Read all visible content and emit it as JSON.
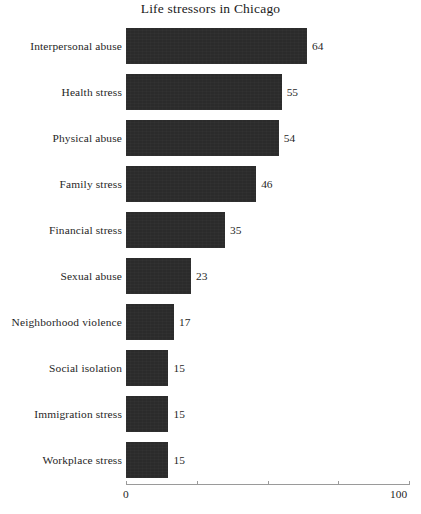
{
  "chart_data": {
    "type": "bar",
    "orientation": "horizontal",
    "title": "Life stressors in Chicago",
    "xlabel": "",
    "ylabel": "",
    "xlim": [
      0,
      100
    ],
    "grid": false,
    "legend": false,
    "bar_color": "#2b2b2b",
    "background_color": "#ffffff",
    "axis_tick_values": [
      0,
      25,
      50,
      75,
      100
    ],
    "axis_tick_labels_shown": [
      "0",
      "100"
    ],
    "categories": [
      "Interpersonal abuse",
      "Health stress",
      "Physical abuse",
      "Family stress",
      "Financial stress",
      "Sexual abuse",
      "Neighborhood violence",
      "Social isolation",
      "Immigration stress",
      "Workplace stress"
    ],
    "values": [
      64,
      55,
      54,
      46,
      35,
      23,
      17,
      15,
      15,
      15
    ],
    "data_labels": [
      "64",
      "55",
      "54",
      "46",
      "35",
      "23",
      "17",
      "15",
      "15",
      "15"
    ]
  },
  "axis": {
    "min_label": "0",
    "max_label": "100"
  }
}
